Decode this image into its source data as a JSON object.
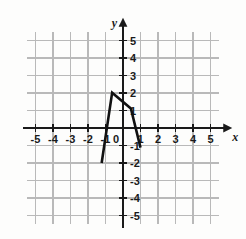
{
  "figure": {
    "title": "",
    "background_color": "#fdfdfc",
    "grid_color": "#b9b9b9",
    "axis_color": "#1a1a1a",
    "curve_color": "#111111"
  },
  "axes": {
    "x_axis_label": "x",
    "y_axis_label": "y",
    "origin_label": "0",
    "x_tick_labels": [
      "-5",
      "-4",
      "-3",
      "-2",
      "-1",
      "1",
      "2",
      "3",
      "4",
      "5"
    ],
    "y_tick_labels": [
      "5",
      "4",
      "3",
      "2",
      "1",
      "-1",
      "-2",
      "-3",
      "-4",
      "-5"
    ]
  },
  "chart_data": {
    "type": "line",
    "title": "",
    "xlabel": "x",
    "ylabel": "y",
    "xlim": [
      -5.5,
      5.5
    ],
    "ylim": [
      -5.5,
      5.5
    ],
    "xticks": [
      -5,
      -4,
      -3,
      -2,
      -1,
      0,
      1,
      2,
      3,
      4,
      5
    ],
    "yticks": [
      -5,
      -4,
      -3,
      -2,
      -1,
      0,
      1,
      2,
      3,
      4,
      5
    ],
    "grid": true,
    "grid_spacing": 1,
    "legend": "none",
    "series": [
      {
        "name": "curve",
        "points": [
          [
            -1.22,
            -2.0
          ],
          [
            -0.62,
            2.02
          ],
          [
            0.45,
            1.12
          ],
          [
            1.0,
            -1.12
          ]
        ]
      }
    ]
  }
}
